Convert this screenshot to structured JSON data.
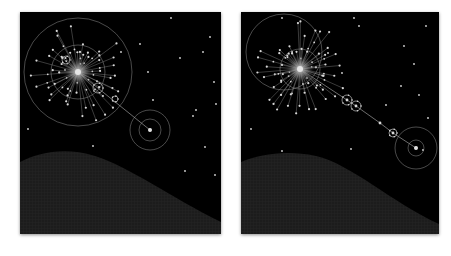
{
  "figure": {
    "background": "#ffffff",
    "panel_background": "#000000",
    "line_color": "#9a9a9a",
    "node_color": "#d8d8d8",
    "hill_color": "#1c1c1c",
    "panels": [
      {
        "id": "left",
        "x": 20,
        "y": 12,
        "w": 201,
        "h": 222,
        "hub": {
          "cx": 58,
          "cy": 60
        },
        "orbits": [
          {
            "cx": 58,
            "cy": 60,
            "r": 54
          },
          {
            "cx": 58,
            "cy": 60,
            "r": 27
          },
          {
            "cx": 130,
            "cy": 118,
            "r": 20
          },
          {
            "cx": 130,
            "cy": 118,
            "r": 11
          }
        ],
        "satellites": [
          {
            "cx": 46,
            "cy": 48,
            "r": 4
          },
          {
            "cx": 78,
            "cy": 76,
            "r": 5
          },
          {
            "cx": 95,
            "cy": 87,
            "r": 3
          }
        ],
        "chain": [
          [
            58,
            60
          ],
          [
            130,
            118
          ]
        ],
        "hill_path": "M0,150 C20,140 45,135 75,144 C110,155 150,185 201,210 L201,222 L0,222 Z",
        "spoke_count": 48,
        "spoke_length": [
          18,
          52
        ],
        "seed": 7
      },
      {
        "id": "right",
        "x": 241,
        "y": 12,
        "w": 198,
        "h": 222,
        "hub": {
          "cx": 59,
          "cy": 57
        },
        "orbits": [
          {
            "cx": 43,
            "cy": 40,
            "r": 38
          },
          {
            "cx": 59,
            "cy": 57,
            "r": 20
          },
          {
            "cx": 175,
            "cy": 136,
            "r": 21
          },
          {
            "cx": 175,
            "cy": 136,
            "r": 8
          }
        ],
        "satellites": [
          {
            "cx": 106,
            "cy": 88,
            "r": 5
          },
          {
            "cx": 115,
            "cy": 94,
            "r": 5
          },
          {
            "cx": 152,
            "cy": 121,
            "r": 4
          }
        ],
        "chain": [
          [
            59,
            57
          ],
          [
            106,
            88
          ],
          [
            115,
            94
          ],
          [
            139,
            111
          ],
          [
            152,
            121
          ],
          [
            175,
            136
          ]
        ],
        "hill_path": "M0,150 C20,142 45,138 75,144 C110,152 150,190 198,212 L198,222 L0,222 Z",
        "spoke_count": 52,
        "spoke_length": [
          16,
          48
        ],
        "seed": 19
      }
    ],
    "stars": {
      "left": [
        [
          151,
          6
        ],
        [
          190,
          25
        ],
        [
          183,
          40
        ],
        [
          160,
          46
        ],
        [
          194,
          70
        ],
        [
          196,
          92
        ],
        [
          133,
          88
        ],
        [
          176,
          98
        ],
        [
          101,
          40
        ],
        [
          128,
          60
        ],
        [
          173,
          104
        ],
        [
          185,
          135
        ],
        [
          8,
          117
        ],
        [
          73,
          134
        ],
        [
          165,
          159
        ],
        [
          195,
          163
        ],
        [
          45,
          58
        ],
        [
          120,
          32
        ]
      ],
      "right": [
        [
          41,
          6
        ],
        [
          113,
          6
        ],
        [
          185,
          14
        ],
        [
          163,
          34
        ],
        [
          173,
          52
        ],
        [
          178,
          83
        ],
        [
          87,
          41
        ],
        [
          66,
          66
        ],
        [
          160,
          74
        ],
        [
          145,
          93
        ],
        [
          187,
          106
        ],
        [
          199,
          116
        ],
        [
          10,
          117
        ],
        [
          41,
          139
        ],
        [
          110,
          137
        ],
        [
          182,
          138
        ],
        [
          118,
          14
        ],
        [
          101,
          61
        ]
      ]
    }
  }
}
